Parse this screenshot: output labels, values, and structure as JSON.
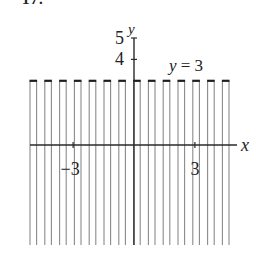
{
  "problem_number": "17.",
  "chart_data": {
    "type": "region",
    "title": "",
    "boundary": {
      "equation": "y = 3",
      "value": 3,
      "style": "dashed"
    },
    "shaded_side": "below",
    "xlabel": "x",
    "ylabel": "y",
    "x_ticks": [
      {
        "value": -3,
        "label": "−3"
      },
      {
        "value": 3,
        "label": "3"
      }
    ],
    "y_ticks": [
      {
        "value": 4,
        "label": "4"
      },
      {
        "value": 5,
        "label": "5"
      }
    ],
    "xlim": [
      -5,
      5
    ],
    "ylim": [
      -5,
      5
    ],
    "annotation": "y = 3",
    "colors": {
      "axis": "#2a2a2a",
      "hatch": "#8a8a8a",
      "boundary": "#1e1e1e"
    }
  }
}
